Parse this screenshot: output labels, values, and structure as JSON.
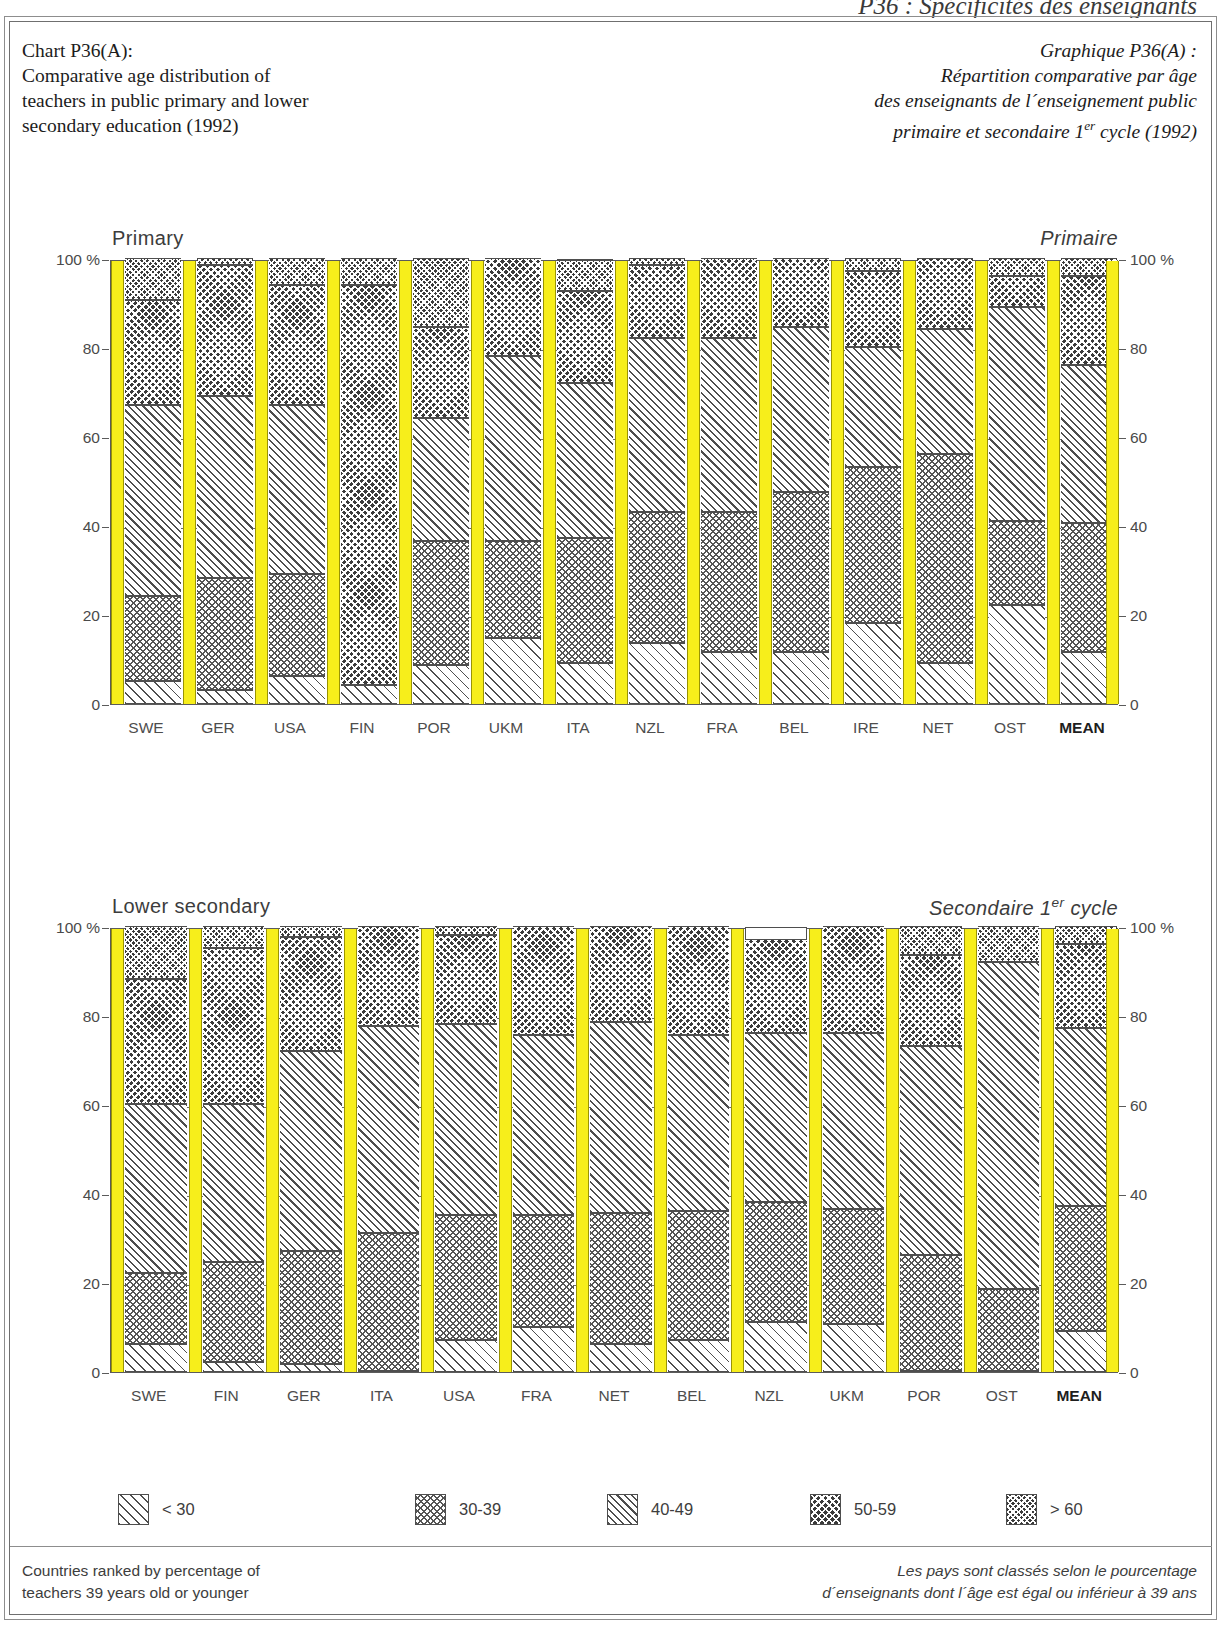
{
  "running_head": "P36 : Spécificités des enseignants",
  "title": {
    "en_line1": "Chart P36(A):",
    "en_line2": "Comparative age distribution of",
    "en_line3": "teachers in public primary and lower",
    "en_line4": "secondary education (1992)",
    "fr_line1": "Graphique P36(A) :",
    "fr_line2": "Répartition comparative par âge",
    "fr_line3": "des enseignants de l´enseignement public",
    "fr_line4_a": "primaire et secondaire 1",
    "fr_line4_sup": "er",
    "fr_line4_b": " cycle (1992)"
  },
  "panels": {
    "primary": {
      "label_en": "Primary",
      "label_fr": "Primaire"
    },
    "lower_secondary": {
      "label_en": "Lower secondary",
      "label_fr": "Secondaire 1er cycle"
    }
  },
  "axis": {
    "ticks": [
      "100 %",
      "80",
      "60",
      "40",
      "20",
      "0"
    ],
    "values": [
      100,
      80,
      60,
      40,
      20,
      0
    ]
  },
  "legend": {
    "items": [
      {
        "label": "< 30",
        "pattern": "p-lt30"
      },
      {
        "label": "30-39",
        "pattern": "p-3039"
      },
      {
        "label": "40-49",
        "pattern": "p-4049"
      },
      {
        "label": "50-59",
        "pattern": "p-5059"
      },
      {
        "label": "> 60",
        "pattern": "p-gt60"
      }
    ]
  },
  "footnote": {
    "en_line1": "Countries ranked by percentage of",
    "en_line2": "teachers 39 years old or younger",
    "fr_line1": "Les pays sont classés selon le pourcentage",
    "fr_line2": "d´enseignants dont l´âge est égal ou inférieur à 39 ans"
  },
  "colors": {
    "bar_separator": "#f7ee1b",
    "outline": "#4e4e4e",
    "text": "#3d3d3d",
    "dark_fill": "#3b3b3b"
  },
  "chart_data": [
    {
      "type": "bar",
      "subtype": "stacked-percentage",
      "title": "Primary",
      "title_fr": "Primaire",
      "xlabel": "",
      "ylabel": "%",
      "ylim": [
        0,
        100
      ],
      "yticks": [
        0,
        20,
        40,
        60,
        80,
        100
      ],
      "grid": true,
      "legend_position": "bottom",
      "categories": [
        "SWE",
        "GER",
        "USA",
        "FIN",
        "POR",
        "UKM",
        "ITA",
        "NZL",
        "FRA",
        "BEL",
        "IRE",
        "NET",
        "OST",
        "MEAN"
      ],
      "series": [
        {
          "name": "< 30",
          "values": [
            5,
            3,
            6,
            4,
            8.5,
            14.5,
            9,
            13.5,
            11.5,
            11.5,
            18,
            9,
            22,
            11.5
          ]
        },
        {
          "name": "30-39",
          "values": [
            19,
            25,
            23,
            0,
            28,
            22,
            28,
            29.5,
            31.5,
            36,
            35,
            47,
            19,
            29
          ]
        },
        {
          "name": "40-49",
          "values": [
            43,
            41,
            38,
            0,
            27.5,
            41.5,
            35,
            39,
            39,
            37,
            27,
            28,
            48,
            35.5
          ]
        },
        {
          "name": "50-59",
          "values": [
            23.5,
            29.5,
            27,
            90,
            20.5,
            22,
            20.5,
            16.5,
            18,
            15.5,
            17,
            16,
            7,
            20
          ]
        },
        {
          "name": "> 60",
          "values": [
            9.5,
            1.5,
            6,
            6,
            15.5,
            0,
            7,
            1.5,
            0,
            0,
            3,
            0,
            4,
            4
          ]
        }
      ]
    },
    {
      "type": "bar",
      "subtype": "stacked-percentage",
      "title": "Lower secondary",
      "title_fr": "Secondaire 1er cycle",
      "xlabel": "",
      "ylabel": "%",
      "ylim": [
        0,
        100
      ],
      "yticks": [
        0,
        20,
        40,
        60,
        80,
        100
      ],
      "grid": true,
      "legend_position": "bottom",
      "categories": [
        "SWE",
        "FIN",
        "GER",
        "ITA",
        "USA",
        "FRA",
        "NET",
        "BEL",
        "NZL",
        "UKM",
        "POR",
        "OST",
        "MEAN"
      ],
      "series": [
        {
          "name": "< 30",
          "values": [
            6,
            2,
            1.5,
            0,
            7,
            10,
            6,
            7,
            11,
            10.5,
            0,
            0,
            9
          ]
        },
        {
          "name": "30-39",
          "values": [
            16,
            22.5,
            25.5,
            31,
            28,
            25,
            29.5,
            29,
            27,
            26,
            26,
            18.5,
            28
          ]
        },
        {
          "name": "40-49",
          "values": [
            38,
            35.5,
            45,
            46.5,
            43,
            40.5,
            43,
            39.5,
            38,
            39.5,
            47,
            73.5,
            40
          ]
        },
        {
          "name": "50-59",
          "values": [
            28,
            35,
            25.5,
            22.5,
            20,
            24.5,
            21.5,
            24.5,
            21,
            24,
            20.5,
            0,
            19
          ]
        },
        {
          "name": "> 60",
          "values": [
            12,
            5,
            2.5,
            0,
            2,
            0,
            0,
            0,
            0,
            0,
            6.5,
            8,
            4
          ]
        }
      ]
    }
  ]
}
